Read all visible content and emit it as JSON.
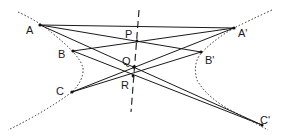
{
  "diagram": {
    "colors": {
      "ink": "#1a1a1a",
      "background": "#ffffff"
    },
    "points": {
      "A": {
        "label": "A",
        "x": 40,
        "y": 25
      },
      "B": {
        "label": "B",
        "x": 73,
        "y": 51
      },
      "C": {
        "label": "C",
        "x": 72,
        "y": 92
      },
      "A'": {
        "label": "A'",
        "x": 234,
        "y": 28
      },
      "B'": {
        "label": "B'",
        "x": 201,
        "y": 52
      },
      "C'": {
        "label": "C'",
        "x": 262,
        "y": 125
      },
      "P": {
        "label": "P",
        "x": 137,
        "y": 41
      },
      "Q": {
        "label": "Q",
        "x": 134,
        "y": 67
      },
      "R": {
        "label": "R",
        "x": 133,
        "y": 76
      }
    },
    "labels": {
      "A": "A",
      "B": "B",
      "C": "C",
      "A_prime": "A'",
      "B_prime": "B'",
      "C_prime": "C'",
      "P": "P",
      "Q": "Q",
      "R": "R"
    },
    "segments": [
      [
        "A",
        "A'"
      ],
      [
        "A",
        "B'"
      ],
      [
        "B",
        "A'"
      ],
      [
        "A",
        "C'"
      ],
      [
        "C",
        "A'"
      ],
      [
        "B",
        "C'"
      ],
      [
        "C",
        "B'"
      ]
    ],
    "curves": [
      "hyperbola-left-branch (dotted)",
      "hyperbola-right-branch (dotted)"
    ],
    "axis_line": "dashed line through P, Q, R"
  }
}
